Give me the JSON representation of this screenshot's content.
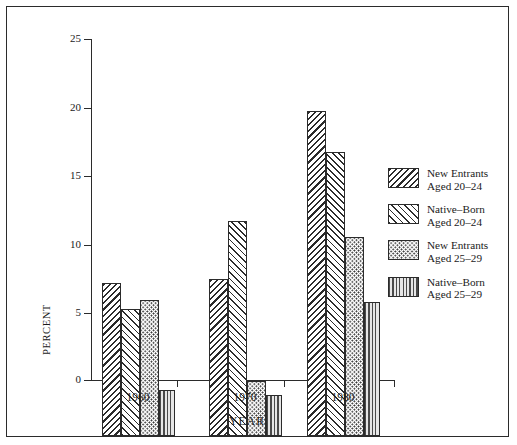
{
  "chart_data": {
    "type": "bar",
    "title": "",
    "xlabel": "YEAR",
    "ylabel": "PERCENT",
    "categories": [
      "1960",
      "1970",
      "1980"
    ],
    "ylim": [
      0,
      25
    ],
    "yticks": [
      0,
      5,
      10,
      15,
      20,
      25
    ],
    "ytick_labels": [
      "0",
      "5",
      "10",
      "15",
      "20",
      "25"
    ],
    "grid": false,
    "legend_position": "right",
    "series": [
      {
        "name": "New Entrants Aged 20-24",
        "label_line1": "New Entrants",
        "label_line2": "Aged 20–24",
        "pattern": "diagonal-hatch",
        "values": [
          11.2,
          11.5,
          23.8
        ]
      },
      {
        "name": "Native-Born Aged 20-24",
        "label_line1": "Native–Born",
        "label_line2": "Aged 20–24",
        "pattern": "cross-hatch",
        "values": [
          9.3,
          15.8,
          20.8
        ]
      },
      {
        "name": "New Entrants Aged 25-29",
        "label_line1": "New Entrants",
        "label_line2": "Aged 25–29",
        "pattern": "dotted",
        "values": [
          10.0,
          4.0,
          14.6
        ]
      },
      {
        "name": "Native-Born Aged 25-29",
        "label_line1": "Native–Born",
        "label_line2": "Aged 25–29",
        "pattern": "vertical-lines",
        "values": [
          3.4,
          3.0,
          9.8
        ]
      }
    ]
  }
}
